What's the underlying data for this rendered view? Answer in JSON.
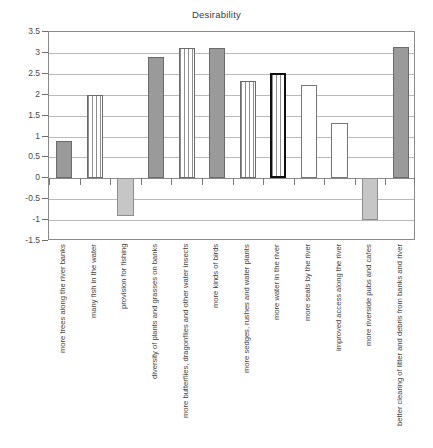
{
  "chart_data": {
    "type": "bar",
    "title": "Desirability",
    "xlabel": "",
    "ylabel": "",
    "ylim": [
      -1.5,
      3.5
    ],
    "ytick_values": [
      3.5,
      3,
      2.5,
      2,
      1.5,
      1,
      0.5,
      0,
      -0.5,
      -1,
      -1.5
    ],
    "ytick_labels": [
      "3.5",
      "3",
      "2.5",
      "2",
      "1.5",
      "1",
      "0.5",
      "0",
      "-0.5",
      "-1",
      "-1.5"
    ],
    "grid": true,
    "legend": "none",
    "categories": [
      "more trees along the river banks",
      "many fish in the water",
      "provision for fishing",
      "diversity of plants and grasses on banks",
      "more butterflies, dragonflies and other water insects",
      "more kinds of birds",
      "more sedges, rushes and water plants",
      "more water in the river",
      "more seats by the river",
      "improved access along the river",
      "more riverside pubs and cafes",
      "better clearing of litter and debris from banks and river"
    ],
    "values": [
      0.9,
      2.0,
      -0.9,
      2.9,
      3.12,
      3.12,
      2.32,
      2.53,
      2.24,
      1.33,
      -1.0,
      3.15
    ],
    "bar_styles": [
      "solid-gray",
      "vertical-stripe",
      "light-gray",
      "solid-gray",
      "vertical-stripe",
      "solid-gray",
      "vertical-stripe",
      "vertical-stripe-highlighted",
      "white",
      "white",
      "light-gray",
      "solid-gray"
    ],
    "label_count": 11,
    "colors": {
      "solid_gray": "#9a9a9a",
      "light_gray": "#c6c6c6",
      "white": "#ffffff",
      "stripe_line": "#8f8f8f",
      "border": "#6b6b6b",
      "highlight_border": "#101010",
      "gridline": "#b9b9b9",
      "axis": "#8a8a8a",
      "text": "#3f3f3f",
      "background": "#ffffff"
    }
  }
}
